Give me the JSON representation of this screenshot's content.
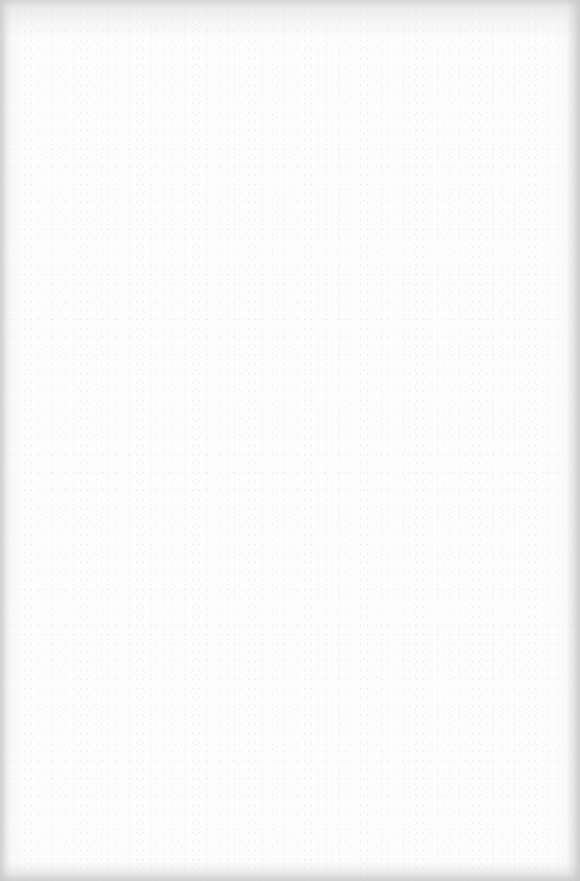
{
  "page": {
    "background_color": "#fdfdfd",
    "edge_shade_color": "#d0d0d0",
    "content": []
  }
}
